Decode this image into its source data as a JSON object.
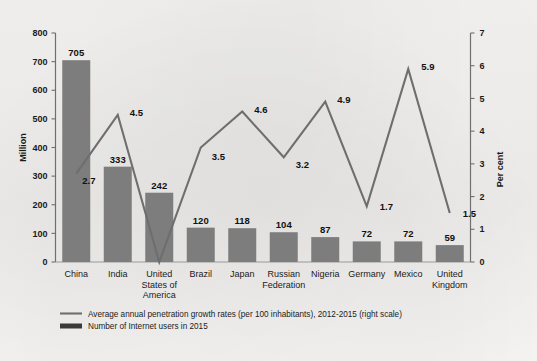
{
  "chart_data": {
    "type": "bar",
    "title": "",
    "subtitle": "",
    "categories": [
      "China",
      "India",
      "United States of America",
      "Brazil",
      "Japan",
      "Russian Federation",
      "Nigeria",
      "Germany",
      "Mexico",
      "United Kingdom"
    ],
    "category_lines": [
      [
        "China"
      ],
      [
        "India"
      ],
      [
        "United",
        "States of",
        "America"
      ],
      [
        "Brazil"
      ],
      [
        "Japan"
      ],
      [
        "Russian",
        "Federation"
      ],
      [
        "Nigeria"
      ],
      [
        "Germany"
      ],
      [
        "Mexico"
      ],
      [
        "United",
        "Kingdom"
      ]
    ],
    "series": [
      {
        "name": "Number of Internet users in 2015",
        "type": "bar",
        "axis": "left",
        "values": [
          705,
          333,
          242,
          120,
          118,
          104,
          87,
          72,
          72,
          59
        ],
        "color": "#7d7d7d"
      },
      {
        "name": "Average annual penetration growth rates  (per 100 inhabitants), 2012-2015 (right scale)",
        "type": "line",
        "axis": "right",
        "values": [
          2.7,
          4.5,
          0.0,
          3.5,
          4.6,
          3.2,
          4.9,
          1.7,
          5.9,
          1.5
        ],
        "labels": [
          "2.7",
          "4.5",
          "",
          "3.5",
          "4.6",
          "3.2",
          "4.9",
          "1.7",
          "5.9",
          "1.5"
        ],
        "color": "#6e6e6e"
      }
    ],
    "xlabel": "",
    "ylabel": "Million",
    "y2label": "Per cent",
    "ylim": [
      0,
      800
    ],
    "y2lim": [
      0,
      7
    ],
    "yticks": [
      "0",
      "100",
      "200",
      "300",
      "400",
      "500",
      "600",
      "700",
      "800"
    ],
    "y2ticks": [
      "0",
      "1",
      "2",
      "3",
      "4",
      "5",
      "6",
      "7"
    ],
    "grid": false,
    "legend_position": "bottom-left"
  },
  "legend": {
    "line_entry": "Average annual penetration growth rates  (per 100 inhabitants), 2012-2015 (right scale)",
    "bar_entry": "Number of Internet users in 2015"
  },
  "axes": {
    "left_title": "Million",
    "right_title": "Per cent"
  }
}
